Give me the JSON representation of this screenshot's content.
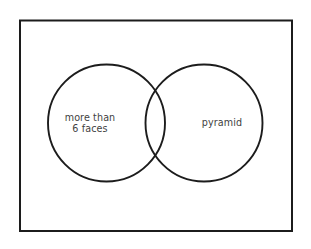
{
  "diagram": {
    "type": "venn",
    "universe": {
      "shape": "rectangle",
      "label": "",
      "border_color": "#1c1c1c"
    },
    "background_color": "#ffffff",
    "stroke_color": "#1c1c1c",
    "text_color": "#3f3f3f",
    "sets": [
      {
        "id": "left",
        "label": "more than\n6 faces",
        "label_line_1": "more than",
        "label_line_2": "6 faces",
        "shape": "circle"
      },
      {
        "id": "right",
        "label": "pyramid",
        "label_line_1": "pyramid",
        "label_line_2": "",
        "shape": "circle"
      }
    ],
    "intersection": {
      "label": "",
      "shaded": false
    }
  }
}
